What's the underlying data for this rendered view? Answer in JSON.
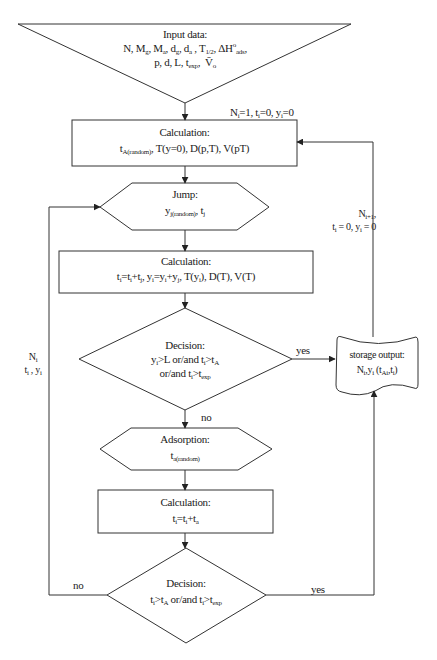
{
  "diagram": {
    "type": "flowchart",
    "stroke_color": "#333333",
    "background": "#ffffff"
  },
  "nodes": {
    "input": {
      "shape": "inverted-triangle",
      "title": "Input data:",
      "line1": "N, Mg, Ma, dg, da, T1/2, ΔH°ads,",
      "line2": "p, d, L, texp, V̄o"
    },
    "calc1": {
      "shape": "rectangle",
      "title": "Calculation:",
      "body": "tA(random), T(y=0), D(p,T), V(pT)"
    },
    "jump": {
      "shape": "hexagon",
      "title": "Jump:",
      "body": "yj(random), tj"
    },
    "calc2": {
      "shape": "rectangle",
      "title": "Calculation:",
      "body": "ti=ti+tj, yi=yi+yj, T(yi), D(T), V(T)"
    },
    "decision1": {
      "shape": "diamond",
      "title": "Decision:",
      "line1": "yi>L or/and ti>tA",
      "line2": "or/and ti>texp"
    },
    "storage": {
      "shape": "document",
      "title": "storage output:",
      "body": "Ni,yi (tA,ti)"
    },
    "adsorption": {
      "shape": "hexagon",
      "title": "Adsorption:",
      "body": "ta(random)"
    },
    "calc3": {
      "shape": "rectangle",
      "title": "Calculation:",
      "body": "ti=ti+ta"
    },
    "decision2": {
      "shape": "diamond",
      "title": "Decision:",
      "body": "ti>tA or/and ti>texp"
    }
  },
  "edge_labels": {
    "init": "Ni=1, ti=0, yi=0",
    "next_particle_1": "Ni+1,",
    "next_particle_2": "ti = 0, yi = 0",
    "loop_left_1": "Ni,",
    "loop_left_2": "ti , yi",
    "d1_yes": "yes",
    "d1_no": "no",
    "d2_no": "no",
    "d2_yes": "yes"
  }
}
